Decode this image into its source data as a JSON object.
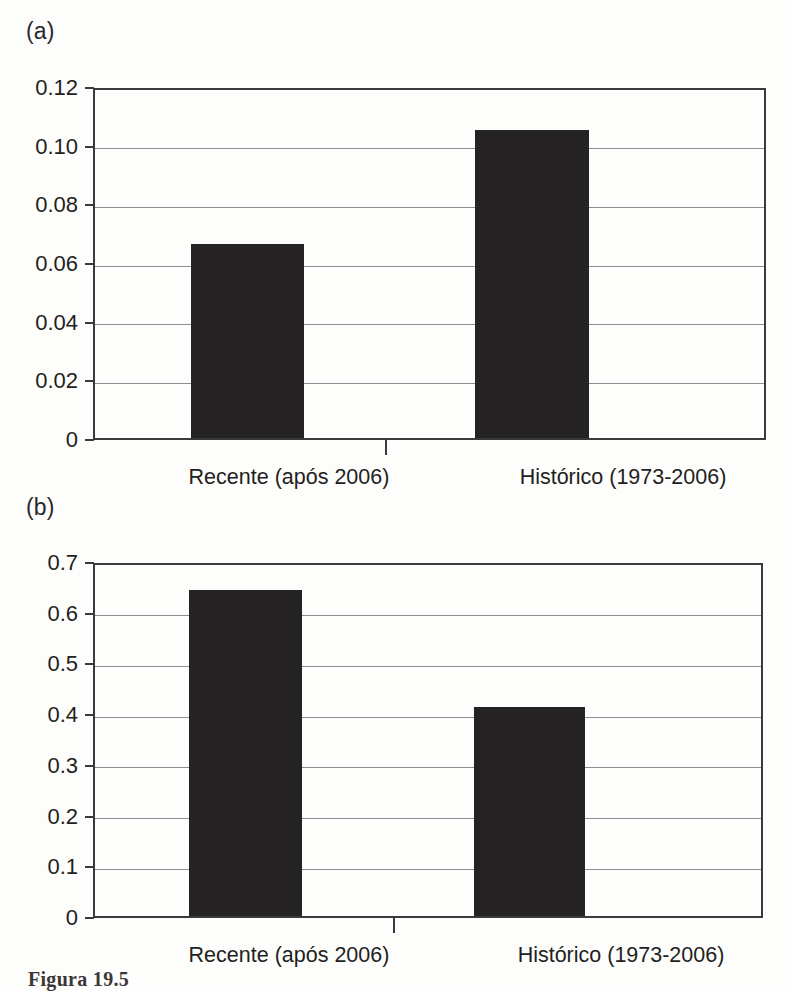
{
  "figure": {
    "caption": "Figura 19.5",
    "panels": [
      {
        "key": "a",
        "label": "(a)"
      },
      {
        "key": "b",
        "label": "(b)"
      }
    ]
  },
  "chart_data": [
    {
      "panel": "(a)",
      "type": "bar",
      "title": "",
      "xlabel": "",
      "ylabel": "",
      "categories": [
        "Recente (após 2006)",
        "Histórico (1973-2006)"
      ],
      "values": [
        0.066,
        0.105
      ],
      "ylim": [
        0,
        0.12
      ],
      "yticks": [
        0,
        0.02,
        0.04,
        0.06,
        0.08,
        0.1,
        0.12
      ],
      "ytick_labels": [
        "0",
        "0.02",
        "0.04",
        "0.06",
        "0.08",
        "0.10",
        "0.12"
      ],
      "grid": true,
      "legend": "none",
      "bar_color": "#262324"
    },
    {
      "panel": "(b)",
      "type": "bar",
      "title": "",
      "xlabel": "",
      "ylabel": "",
      "categories": [
        "Recente (após 2006)",
        "Histórico (1973-2006)"
      ],
      "values": [
        0.643,
        0.412
      ],
      "ylim": [
        0,
        0.7
      ],
      "yticks": [
        0,
        0.1,
        0.2,
        0.3,
        0.4,
        0.5,
        0.6,
        0.7
      ],
      "ytick_labels": [
        "0",
        "0.1",
        "0.2",
        "0.3",
        "0.4",
        "0.5",
        "0.6",
        "0.7"
      ],
      "grid": true,
      "legend": "none",
      "bar_color": "#262324"
    }
  ]
}
